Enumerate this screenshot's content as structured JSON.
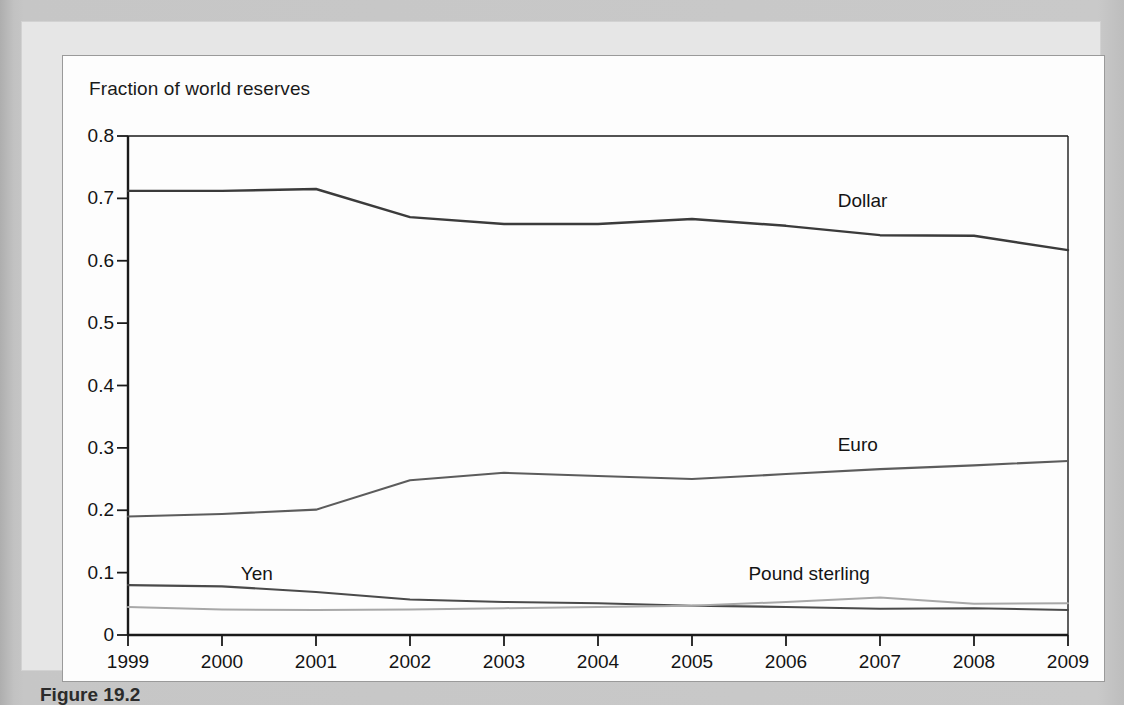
{
  "figure": {
    "caption": "Figure 19.2"
  },
  "chart_data": {
    "type": "line",
    "title": "Fraction of world reserves",
    "xlabel": "",
    "ylabel": "Fraction of world reserves",
    "x": [
      1999,
      2000,
      2001,
      2002,
      2003,
      2004,
      2005,
      2006,
      2007,
      2008,
      2009
    ],
    "xtick_labels": [
      "1999",
      "2000",
      "2001",
      "2002",
      "2003",
      "2004",
      "2005",
      "2006",
      "2007",
      "2008",
      "2009"
    ],
    "ytick_labels": [
      "0",
      "0.1",
      "0.2",
      "0.3",
      "0.4",
      "0.5",
      "0.6",
      "0.7",
      "0.8"
    ],
    "yticks": [
      0,
      0.1,
      0.2,
      0.3,
      0.4,
      0.5,
      0.6,
      0.7,
      0.8
    ],
    "xlim": [
      1999,
      2009
    ],
    "ylim": [
      0,
      0.8
    ],
    "grid": false,
    "legend_position": "inline-annotations",
    "series": [
      {
        "name": "Dollar",
        "color": "#3b3b3b",
        "width": 2.4,
        "label_x": 2006.55,
        "label_y": 0.695,
        "values": [
          0.712,
          0.712,
          0.715,
          0.67,
          0.659,
          0.659,
          0.667,
          0.656,
          0.641,
          0.64,
          0.617
        ]
      },
      {
        "name": "Euro",
        "color": "#5c5c5c",
        "width": 2.1,
        "label_x": 2006.55,
        "label_y": 0.305,
        "values": [
          0.19,
          0.194,
          0.201,
          0.248,
          0.26,
          0.255,
          0.25,
          0.258,
          0.266,
          0.272,
          0.279
        ]
      },
      {
        "name": "Yen",
        "color": "#4a4a4a",
        "width": 2.1,
        "label_x": 2000.2,
        "label_y": 0.098,
        "values": [
          0.08,
          0.078,
          0.069,
          0.057,
          0.053,
          0.051,
          0.047,
          0.045,
          0.042,
          0.043,
          0.04
        ]
      },
      {
        "name": "Pound sterling",
        "color": "#a8a8a8",
        "width": 2.0,
        "label_x": 2005.6,
        "label_y": 0.098,
        "values": [
          0.045,
          0.041,
          0.04,
          0.041,
          0.043,
          0.045,
          0.047,
          0.053,
          0.06,
          0.05,
          0.051
        ]
      }
    ]
  }
}
